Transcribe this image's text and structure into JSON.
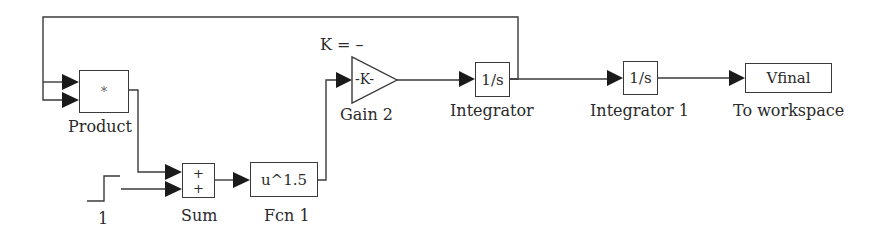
{
  "diagram": {
    "type": "simulink-block-diagram",
    "colors": {
      "line": "#3a3a3a",
      "text": "#2a2a2a",
      "background": "#ffffff"
    },
    "blocks": {
      "product": {
        "symbol": "*",
        "label": "Product"
      },
      "step": {
        "label": "1"
      },
      "sum": {
        "signs": [
          "+",
          "+"
        ],
        "label": "Sum"
      },
      "fcn": {
        "expr": "u^1.5",
        "label": "Fcn 1"
      },
      "gain": {
        "value": "-K-",
        "label": "Gain 2",
        "annotation": "K = –"
      },
      "integrator": {
        "expr": "1/s",
        "label": "Integrator"
      },
      "integrator1": {
        "expr": "1/s",
        "label": "Integrator 1"
      },
      "to_workspace": {
        "var": "Vfinal",
        "label": "To workspace"
      }
    },
    "connections": [
      "Integrator -> Product (in1, in2) feedback",
      "Product -> Sum (in1)",
      "Step -> Sum (in2)",
      "Sum -> Fcn 1",
      "Fcn 1 -> Gain 2",
      "Gain 2 -> Integrator",
      "Integrator -> Integrator 1",
      "Integrator 1 -> To workspace"
    ]
  }
}
